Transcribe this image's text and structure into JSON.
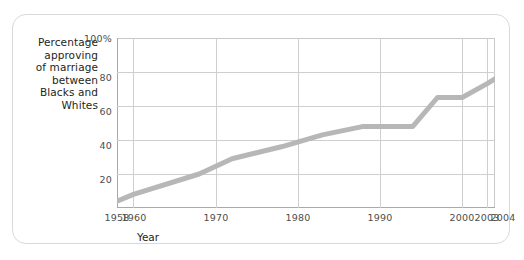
{
  "figure": {
    "frame_color": "#d9d9d9",
    "background": "#ffffff"
  },
  "chart_data": {
    "type": "line",
    "title": "",
    "ylabel": "Percentage approving of marriage between Blacks and Whites",
    "ylabel_lines": [
      "Percentage",
      "approving",
      "of marriage",
      "between",
      "Blacks and",
      "Whites"
    ],
    "xlabel": "Year",
    "xlim": [
      1958,
      2004
    ],
    "ylim": [
      0,
      100
    ],
    "grid": true,
    "legend": "none",
    "line_color": "#b7b7b7",
    "line_width": 5,
    "ytick_labels": [
      "100%",
      "80",
      "60",
      "40",
      "20"
    ],
    "ytick_values": [
      100,
      80,
      60,
      40,
      20
    ],
    "xtick_labels": [
      "1958",
      "1960",
      "1970",
      "1980",
      "1990",
      "2000",
      "2003",
      "2004"
    ],
    "xtick_values": [
      1958,
      1960,
      1970,
      1980,
      1990,
      2000,
      2003,
      2004
    ],
    "x": [
      1958,
      1960,
      1968,
      1972,
      1978,
      1983,
      1988,
      1991,
      1994,
      1997,
      2000,
      2003,
      2004
    ],
    "values": [
      4,
      8,
      20,
      29,
      36,
      43,
      48,
      48,
      48,
      65,
      65,
      73,
      76
    ],
    "series": [
      {
        "name": "Percentage approving",
        "values": [
          4,
          8,
          20,
          29,
          36,
          43,
          48,
          48,
          48,
          65,
          65,
          73,
          76
        ]
      }
    ]
  }
}
